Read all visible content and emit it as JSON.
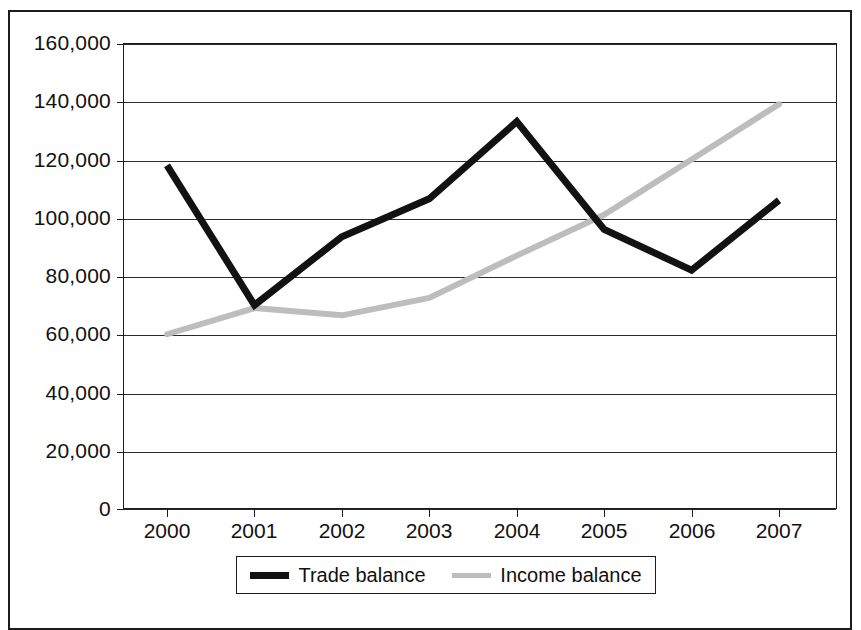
{
  "chart_data": {
    "type": "line",
    "title": "",
    "subtitle": "",
    "xlabel": "",
    "ylabel": "",
    "categories": [
      "2000",
      "2001",
      "2002",
      "2003",
      "2004",
      "2005",
      "2006",
      "2007"
    ],
    "x": [
      2000,
      2001,
      2002,
      2003,
      2004,
      2005,
      2006,
      2007
    ],
    "series": [
      {
        "name": "Trade balance",
        "color": "#121212",
        "linewidth": 7,
        "values": [
          118000,
          70000,
          93500,
          106500,
          133000,
          96000,
          82000,
          106000
        ]
      },
      {
        "name": "Income balance",
        "color": "#bdbdbd",
        "linewidth": 6,
        "values": [
          60000,
          69000,
          66500,
          72500,
          87000,
          101000,
          120000,
          139000
        ]
      }
    ],
    "ylim": [
      0,
      160000
    ],
    "xlim": [
      2000,
      2007
    ],
    "ytick_labels": [
      "160,000",
      "140,000",
      "120,000",
      "100,000",
      "80,000",
      "60,000",
      "40,000",
      "20,000",
      "0"
    ],
    "ytick_values": [
      160000,
      140000,
      120000,
      100000,
      80000,
      60000,
      40000,
      20000,
      0
    ],
    "grid": true,
    "grid_axis": "y",
    "legend_position": "bottom",
    "legend_entries": [
      "Trade balance",
      "Income balance"
    ]
  },
  "legend": {
    "items": [
      {
        "label": "Trade balance",
        "swatch": "trade"
      },
      {
        "label": "Income balance",
        "swatch": "income"
      }
    ]
  },
  "colors": {
    "trade_balance": "#121212",
    "income_balance": "#bdbdbd",
    "axis": "#1c1c1c",
    "grid": "#2b2b2b",
    "background": "#ffffff"
  }
}
